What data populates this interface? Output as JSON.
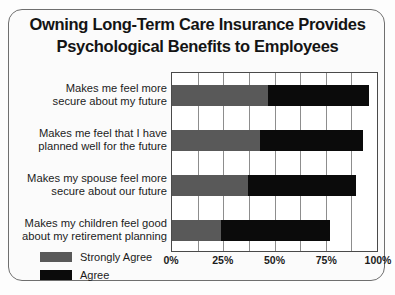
{
  "chart_data": {
    "type": "bar",
    "orientation": "horizontal",
    "stacked": true,
    "title": "Owning Long-Term Care Insurance Provides\nPsychological Benefits to Employees",
    "xlabel": "",
    "ylabel": "",
    "xlim": [
      0,
      100
    ],
    "xticks": [
      0,
      25,
      50,
      75,
      100
    ],
    "xticklabels": [
      "0%",
      "25%",
      "50%",
      "75%",
      "100%"
    ],
    "gridline_interval": 12.5,
    "grid": true,
    "legend_position": "bottom-left",
    "categories": [
      "Makes me feel more\nsecure about my future",
      "Makes me feel that I have\nplanned well for the future",
      "Makes my spouse feel more\nsecure about our future",
      "Makes my children feel good\nabout my retirement planning"
    ],
    "series": [
      {
        "name": "Strongly Agree",
        "color": "#595959",
        "values": [
          47,
          43,
          37,
          24
        ]
      },
      {
        "name": "Agree",
        "color": "#0b0b0b",
        "values": [
          49,
          50,
          53,
          53
        ]
      }
    ],
    "totals": [
      96,
      93,
      90,
      77
    ]
  },
  "legend": {
    "items": [
      {
        "label": "Strongly Agree",
        "color": "#595959"
      },
      {
        "label": "Agree",
        "color": "#0b0b0b"
      }
    ]
  },
  "colors": {
    "strongly_agree": "#595959",
    "agree": "#0b0b0b",
    "frame_border": "#6f6f6f",
    "axis": "#4a4a4a",
    "gridline": "#8d8d8d",
    "background": "#fbfbfb",
    "text": "#1b1b1b"
  }
}
